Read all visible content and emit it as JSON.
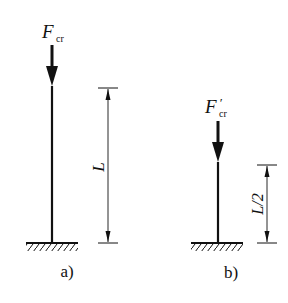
{
  "figure_a": {
    "force_symbol": "F",
    "force_subscript": "cr",
    "length_label": "L",
    "caption": "a)"
  },
  "figure_b": {
    "force_symbol": "F",
    "force_prime": "′",
    "force_subscript": "cr",
    "length_label": "L/2",
    "caption": "b)"
  },
  "colors": {
    "ink": "#111111",
    "background": "#ffffff"
  }
}
